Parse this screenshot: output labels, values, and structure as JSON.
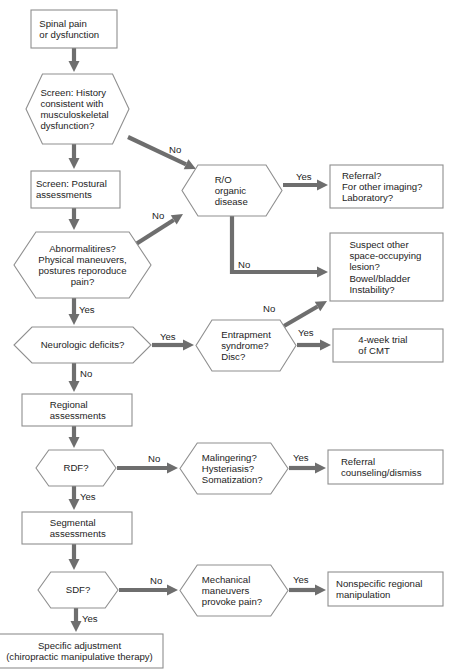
{
  "diagram": {
    "type": "flowchart",
    "colors": {
      "node_border": "#8f8f8f",
      "node_fill": "#ffffff",
      "edge": "#6e6e6e",
      "text": "#1d1d1d"
    },
    "nodes": [
      {
        "id": "n1",
        "shape": "box",
        "lines": [
          "Spinal pain",
          "or dysfunction"
        ],
        "align": "start",
        "x": 31,
        "y": 10,
        "w": 86,
        "h": 38
      },
      {
        "id": "n2",
        "shape": "hexagon",
        "lines": [
          "Screen: History",
          "consistent with",
          "musculoskeletal",
          "dysfunction?"
        ],
        "align": "start",
        "x": 26,
        "y": 74,
        "w": 103,
        "h": 70
      },
      {
        "id": "n3",
        "shape": "box",
        "lines": [
          "Screen: Postural",
          "assessments"
        ],
        "align": "start",
        "x": 31,
        "y": 171,
        "w": 89,
        "h": 37
      },
      {
        "id": "n4",
        "shape": "hexagon",
        "lines": [
          "Abnormalitires?",
          "Physical maneuvers,",
          "postures reporoduce",
          "pain?"
        ],
        "align": "middle",
        "x": 14,
        "y": 232,
        "w": 137,
        "h": 66
      },
      {
        "id": "n5",
        "shape": "hexagon",
        "lines": [
          "Neurologic deficits?"
        ],
        "align": "middle",
        "x": 14,
        "y": 327,
        "w": 137,
        "h": 36
      },
      {
        "id": "n6",
        "shape": "box",
        "lines": [
          "Regional",
          "assessments"
        ],
        "align": "start",
        "x": 22,
        "y": 394,
        "w": 110,
        "h": 32
      },
      {
        "id": "n7",
        "shape": "hexagon",
        "lines": [
          "RDF?"
        ],
        "align": "middle",
        "x": 36,
        "y": 450,
        "w": 80,
        "h": 36
      },
      {
        "id": "n8",
        "shape": "box",
        "lines": [
          "Segmental",
          "assessments"
        ],
        "align": "start",
        "x": 22,
        "y": 512,
        "w": 110,
        "h": 32
      },
      {
        "id": "n9",
        "shape": "hexagon",
        "lines": [
          "SDF?"
        ],
        "align": "middle",
        "x": 38,
        "y": 572,
        "w": 80,
        "h": 36
      },
      {
        "id": "n10",
        "shape": "box",
        "lines": [
          "Specific adjustment",
          "(chiropractic manipulative therapy)"
        ],
        "align": "middle",
        "x": -4,
        "y": 634,
        "w": 167,
        "h": 34
      },
      {
        "id": "n11",
        "shape": "hexagon",
        "lines": [
          "R/O",
          "organic",
          "disease"
        ],
        "align": "start",
        "x": 182,
        "y": 165,
        "w": 100,
        "h": 51
      },
      {
        "id": "n12",
        "shape": "box",
        "lines": [
          "Referral?",
          "For other imaging?",
          "Laboratory?"
        ],
        "align": "start",
        "x": 330,
        "y": 165,
        "w": 113,
        "h": 43
      },
      {
        "id": "n13",
        "shape": "box",
        "lines": [
          "Suspect other",
          "space-occupying",
          "lesion?",
          "Bowel/bladder",
          "Instability?"
        ],
        "align": "start",
        "x": 330,
        "y": 233,
        "w": 113,
        "h": 68
      },
      {
        "id": "n14",
        "shape": "hexagon",
        "lines": [
          "Entrapment",
          "syndrome?",
          "Disc?"
        ],
        "align": "start",
        "x": 196,
        "y": 320,
        "w": 100,
        "h": 51
      },
      {
        "id": "n15",
        "shape": "box",
        "lines": [
          "4-week trial",
          "of CMT"
        ],
        "align": "start",
        "x": 333,
        "y": 329,
        "w": 110,
        "h": 33
      },
      {
        "id": "n16",
        "shape": "hexagon",
        "lines": [
          "Malingering?",
          "Hysteriasis?",
          "Somatization?"
        ],
        "align": "start",
        "x": 180,
        "y": 443,
        "w": 108,
        "h": 51
      },
      {
        "id": "n17",
        "shape": "box",
        "lines": [
          "Referral",
          "counseling/dismiss"
        ],
        "align": "start",
        "x": 328,
        "y": 450,
        "w": 115,
        "h": 34
      },
      {
        "id": "n18",
        "shape": "hexagon",
        "lines": [
          "Mechanical",
          "maneuvers",
          "provoke pain?"
        ],
        "align": "start",
        "x": 180,
        "y": 565,
        "w": 108,
        "h": 51
      },
      {
        "id": "n19",
        "shape": "box",
        "lines": [
          "Nonspecific regional",
          "manipulation"
        ],
        "align": "start",
        "x": 328,
        "y": 572,
        "w": 115,
        "h": 34
      }
    ],
    "edges": [
      {
        "id": "e1",
        "from": "n1",
        "to": "n2",
        "label": "",
        "points": [
          [
            74,
            48
          ],
          [
            74,
            72
          ]
        ],
        "label_xy": [
          0,
          0
        ]
      },
      {
        "id": "e2",
        "from": "n2",
        "to": "n3",
        "label": "",
        "points": [
          [
            74,
            144
          ],
          [
            74,
            169
          ]
        ],
        "label_xy": [
          0,
          0
        ]
      },
      {
        "id": "e3",
        "from": "n2",
        "to": "n11",
        "label": "No",
        "points": [
          [
            128,
            137
          ],
          [
            196,
            169
          ]
        ],
        "label_xy": [
          169,
          153
        ]
      },
      {
        "id": "e4",
        "from": "n3",
        "to": "n4",
        "label": "",
        "points": [
          [
            74,
            208
          ],
          [
            74,
            230
          ]
        ],
        "label_xy": [
          0,
          0
        ]
      },
      {
        "id": "e5",
        "from": "n4",
        "to": "n11",
        "label": "No",
        "points": [
          [
            136,
            244
          ],
          [
            183,
            214
          ]
        ],
        "label_xy": [
          152,
          219
        ]
      },
      {
        "id": "e6",
        "from": "n4",
        "to": "n5",
        "label": "Yes",
        "points": [
          [
            74,
            298
          ],
          [
            74,
            325
          ]
        ],
        "label_xy": [
          79,
          313
        ]
      },
      {
        "id": "e7",
        "from": "n11",
        "to": "n12",
        "label": "Yes",
        "points": [
          [
            283,
            185
          ],
          [
            328,
            185
          ]
        ],
        "label_xy": [
          296,
          180
        ]
      },
      {
        "id": "e8",
        "from": "n11",
        "to": "n13",
        "label": "No",
        "points": [
          [
            232,
            216
          ],
          [
            232,
            272
          ],
          [
            328,
            272
          ]
        ],
        "label_xy": [
          238,
          268
        ]
      },
      {
        "id": "e9",
        "from": "n5",
        "to": "n14",
        "label": "Yes",
        "points": [
          [
            152,
            345
          ],
          [
            194,
            345
          ]
        ],
        "label_xy": [
          160,
          340
        ]
      },
      {
        "id": "e10",
        "from": "n5",
        "to": "n6",
        "label": "No",
        "points": [
          [
            74,
            363
          ],
          [
            74,
            392
          ]
        ],
        "label_xy": [
          80,
          377
        ]
      },
      {
        "id": "e11",
        "from": "n14",
        "to": "n13",
        "label": "No",
        "points": [
          [
            284,
            326
          ],
          [
            327,
            301
          ]
        ],
        "label_xy": [
          263,
          312
        ]
      },
      {
        "id": "e12",
        "from": "n14",
        "to": "n15",
        "label": "Yes",
        "points": [
          [
            297,
            345
          ],
          [
            331,
            345
          ]
        ],
        "label_xy": [
          298,
          336
        ]
      },
      {
        "id": "e13",
        "from": "n6",
        "to": "n7",
        "label": "",
        "points": [
          [
            74,
            426
          ],
          [
            74,
            448
          ]
        ],
        "label_xy": [
          0,
          0
        ]
      },
      {
        "id": "e14",
        "from": "n7",
        "to": "n16",
        "label": "No",
        "points": [
          [
            117,
            468
          ],
          [
            178,
            468
          ]
        ],
        "label_xy": [
          148,
          462
        ]
      },
      {
        "id": "e15",
        "from": "n7",
        "to": "n8",
        "label": "Yes",
        "points": [
          [
            74,
            486
          ],
          [
            74,
            510
          ]
        ],
        "label_xy": [
          80,
          500
        ]
      },
      {
        "id": "e16",
        "from": "n16",
        "to": "n17",
        "label": "Yes",
        "points": [
          [
            289,
            468
          ],
          [
            326,
            468
          ]
        ],
        "label_xy": [
          293,
          461
        ]
      },
      {
        "id": "e17",
        "from": "n8",
        "to": "n9",
        "label": "",
        "points": [
          [
            74,
            544
          ],
          [
            74,
            570
          ]
        ],
        "label_xy": [
          0,
          0
        ]
      },
      {
        "id": "e18",
        "from": "n9",
        "to": "n18",
        "label": "No",
        "points": [
          [
            119,
            590
          ],
          [
            178,
            590
          ]
        ],
        "label_xy": [
          150,
          584
        ]
      },
      {
        "id": "e19",
        "from": "n9",
        "to": "n10",
        "label": "Yes",
        "points": [
          [
            76,
            608
          ],
          [
            76,
            632
          ]
        ],
        "label_xy": [
          82,
          622
        ]
      },
      {
        "id": "e20",
        "from": "n18",
        "to": "n19",
        "label": "Yes",
        "points": [
          [
            289,
            590
          ],
          [
            326,
            590
          ]
        ],
        "label_xy": [
          293,
          583
        ]
      }
    ]
  }
}
